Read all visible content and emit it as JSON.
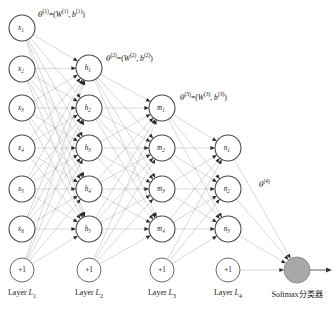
{
  "figure": {
    "type": "neural-network-architecture-diagram",
    "width": 336,
    "height": 310,
    "background": "#ffffff",
    "edge_color": "#9b9b9b",
    "node_stroke_color": "#4a4a4a",
    "softmax_fill": "#a8a8a8"
  },
  "layers": [
    {
      "id": "L1",
      "caption_prefix": "Layer",
      "caption_symbol": "L",
      "caption_subscript": "1",
      "x": 22,
      "nodes": [
        {
          "name": "x1",
          "base": "x",
          "sub": "1",
          "y": 28
        },
        {
          "name": "x2",
          "base": "x",
          "sub": "2",
          "y": 69
        },
        {
          "name": "x3",
          "base": "x",
          "sub": "3",
          "y": 108
        },
        {
          "name": "x4",
          "base": "x",
          "sub": "4",
          "y": 148
        },
        {
          "name": "x5",
          "base": "x",
          "sub": "5",
          "y": 189
        },
        {
          "name": "x6",
          "base": "x",
          "sub": "6",
          "y": 229
        }
      ],
      "bias": {
        "label": "+1",
        "y": 270
      }
    },
    {
      "id": "L2",
      "caption_prefix": "Layer",
      "caption_symbol": "L",
      "caption_subscript": "2",
      "x": 89,
      "nodes": [
        {
          "name": "h1",
          "base": "h",
          "sub": "1",
          "y": 68
        },
        {
          "name": "h2",
          "base": "h",
          "sub": "2",
          "y": 108
        },
        {
          "name": "h3",
          "base": "h",
          "sub": "3",
          "y": 148
        },
        {
          "name": "h4",
          "base": "h",
          "sub": "4",
          "y": 189
        },
        {
          "name": "h5",
          "base": "h",
          "sub": "5",
          "y": 229
        }
      ],
      "bias": {
        "label": "+1",
        "y": 270
      }
    },
    {
      "id": "L3",
      "caption_prefix": "Layer",
      "caption_symbol": "L",
      "caption_subscript": "3",
      "x": 162,
      "nodes": [
        {
          "name": "m1",
          "base": "m",
          "sub": "1",
          "y": 108
        },
        {
          "name": "m2",
          "base": "m",
          "sub": "2",
          "y": 148
        },
        {
          "name": "m3",
          "base": "m",
          "sub": "3",
          "y": 189
        },
        {
          "name": "m4",
          "base": "m",
          "sub": "4",
          "y": 229
        }
      ],
      "bias": {
        "label": "+1",
        "y": 270
      }
    },
    {
      "id": "L4",
      "caption_prefix": "Layer",
      "caption_symbol": "L",
      "caption_subscript": "4",
      "x": 228,
      "nodes": [
        {
          "name": "n1",
          "base": "n",
          "sub": "1",
          "y": 148
        },
        {
          "name": "n2",
          "base": "n",
          "sub": "2",
          "y": 189
        },
        {
          "name": "n3",
          "base": "n",
          "sub": "3",
          "y": 229
        }
      ],
      "bias": {
        "label": "+1",
        "y": 270
      }
    }
  ],
  "output": {
    "id": "softmax",
    "x": 297,
    "y": 270,
    "radius": 13,
    "caption": "Softmax分类器"
  },
  "node_radius": 13,
  "bias_radius": 12,
  "theta_labels": [
    {
      "id": "theta1",
      "symbol": "θ",
      "superscript": "(1)",
      "text": "θ(1)=(W(1), b(1))",
      "w_symbol": "W",
      "w_superscript": "(1)",
      "b_symbol": "b",
      "b_superscript": "(1)",
      "x": 38,
      "y": 8
    },
    {
      "id": "theta2",
      "symbol": "θ",
      "superscript": "(2)",
      "text": "θ(2)=(W(2), b(2))",
      "w_symbol": "W",
      "w_superscript": "(2)",
      "b_symbol": "b",
      "b_superscript": "(2)",
      "x": 106,
      "y": 52
    },
    {
      "id": "theta3",
      "symbol": "θ",
      "superscript": "(3)",
      "text": "θ(3)=(W(3), b(3))",
      "w_symbol": "W",
      "w_superscript": "(3)",
      "b_symbol": "b",
      "b_superscript": "(3)",
      "x": 180,
      "y": 91
    },
    {
      "id": "theta4",
      "symbol": "θ",
      "superscript": "(4)",
      "text": "θ(4)",
      "x": 259,
      "y": 178
    }
  ],
  "layer_caption_y": 288
}
